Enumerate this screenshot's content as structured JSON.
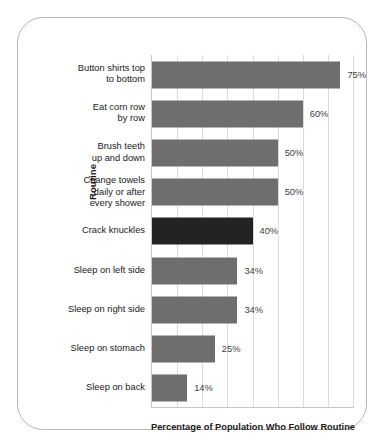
{
  "chart_data": {
    "type": "bar",
    "orientation": "horizontal",
    "title": "",
    "xlabel": "Percentage of Population Who Follow Routine",
    "ylabel": "Routine",
    "xlim": [
      0,
      80
    ],
    "grid": true,
    "gridline_values": [
      0,
      10,
      20,
      30,
      40,
      50,
      60,
      70,
      80
    ],
    "legend": "none",
    "value_suffix": "%",
    "colors": {
      "bar": "#6e6e6e",
      "bar_highlight": "#232323",
      "gridline": "#dedcda",
      "axis": "#c9c7c4",
      "text": "#1a1a1a",
      "value_text": "#3d3d3d",
      "card_border": "#b9b7b4",
      "background": "#ffffff"
    },
    "categories": [
      "Button shirts top\nto bottom",
      "Eat corn row\nby row",
      "Brush teeth\nup and down",
      "Change towels\ndaily or after\nevery shower",
      "Crack knuckles",
      "Sleep on left side",
      "Sleep on right side",
      "Sleep on stomach",
      "Sleep on back"
    ],
    "values": [
      75,
      60,
      50,
      50,
      40,
      34,
      34,
      25,
      14
    ],
    "value_labels": [
      "75%",
      "60%",
      "50%",
      "50%",
      "40%",
      "34%",
      "34%",
      "25%",
      "14%"
    ],
    "highlighted_index": 4
  }
}
